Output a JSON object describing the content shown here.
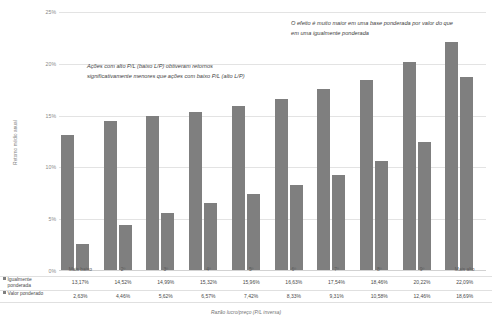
{
  "chart_data": {
    "type": "bar",
    "title": "",
    "xlabel": "Razão lucro/preço (P/L inversa)",
    "ylabel": "Retorno médio anual",
    "ylim": [
      0,
      25
    ],
    "ytick_labels": [
      "25%",
      "20%",
      "15%",
      "10%",
      "5%",
      "0%"
    ],
    "ytick_values": [
      25,
      20,
      15,
      10,
      5,
      0
    ],
    "grid": true,
    "legend_position": "bottom-left-table",
    "categories": [
      "Mais baixo",
      "2º",
      "3º",
      "4º",
      "5º",
      "6º",
      "7º",
      "8º",
      "9º",
      "Mais alto"
    ],
    "series": [
      {
        "name": "Igualmente ponderada",
        "values": [
          13.17,
          14.52,
          14.99,
          15.32,
          15.96,
          16.63,
          17.54,
          18.46,
          20.22,
          22.09
        ],
        "labels": [
          "13,17%",
          "14,52%",
          "14,99%",
          "15,32%",
          "15,96%",
          "16,63%",
          "17,54%",
          "18,46%",
          "20,22%",
          "22,09%"
        ],
        "color": "#7f7f7f"
      },
      {
        "name": "Valor ponderado",
        "values": [
          2.63,
          4.46,
          5.62,
          6.57,
          7.42,
          8.33,
          9.31,
          10.58,
          12.46,
          18.69
        ],
        "labels": [
          "2,63%",
          "4,46%",
          "5,62%",
          "6,57%",
          "7,42%",
          "8,33%",
          "9,31%",
          "10,58%",
          "12,46%",
          "18,69%"
        ],
        "color": "#7f7f7f"
      }
    ],
    "annotations": [
      {
        "name": "annotation-left",
        "text": "Ações com alto P/L (baixo L/P) obtiveram retornos significativamente menores que ações com baixo P/L (alto L/P)"
      },
      {
        "name": "annotation-right",
        "text": "O efeito é muito maior em uma base ponderada por valor do que em uma igualmente ponderada"
      }
    ]
  },
  "legend": {
    "series_1_line_1": "Igualmente",
    "series_1_line_2": "ponderada",
    "series_2": "Valor ponderado"
  }
}
